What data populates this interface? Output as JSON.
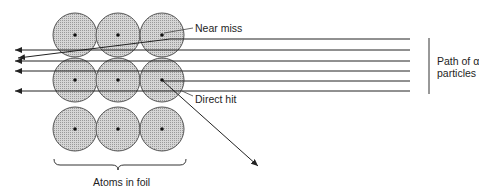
{
  "figure": {
    "labels": {
      "near_miss": "Near miss",
      "direct_hit": "Direct hit",
      "path_line1": "Path of α",
      "path_line2": "particles",
      "atoms": "Atoms in foil"
    },
    "atoms": {
      "columns_x": [
        75,
        118,
        162
      ],
      "rows_y": [
        35,
        80,
        129
      ],
      "radius": 22,
      "fill": "#c8c8c8",
      "stroke": "#555555",
      "nucleus_color": "#111111"
    },
    "alpha_paths": {
      "start_x": 410,
      "y_values": [
        39,
        50,
        61,
        71,
        81,
        91
      ],
      "line_color": "#222222"
    }
  }
}
